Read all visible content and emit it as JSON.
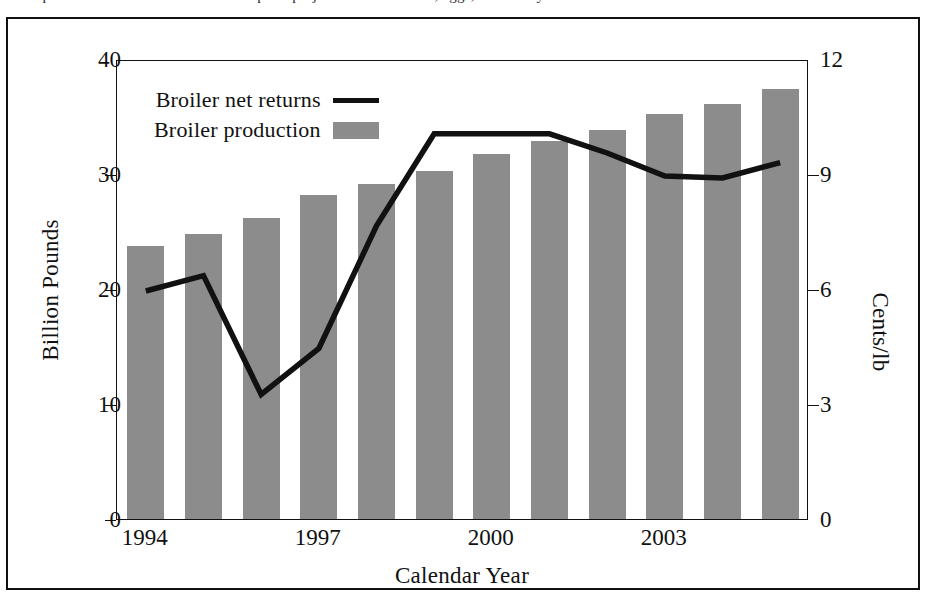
{
  "page": {
    "top_text_fragment": "anticipated to rise. This section reviews price projections for broilers, eggs, and turkeys."
  },
  "legend": {
    "items": [
      {
        "label": "Broiler net returns",
        "marker": "line-swatch",
        "color": "#111111"
      },
      {
        "label": "Broiler production",
        "marker": "bar-swatch",
        "color": "#8c8c8c"
      }
    ]
  },
  "axes": {
    "left": {
      "title": "Billion Pounds",
      "ticks": [
        "0",
        "10",
        "20",
        "30",
        "40"
      ],
      "min": 0,
      "max": 40
    },
    "right": {
      "title": "Cents/lb",
      "ticks": [
        "0",
        "3",
        "6",
        "9",
        "12"
      ],
      "min": 0,
      "max": 12
    },
    "bottom": {
      "title": "Calendar Year",
      "ticks": [
        "1994",
        "1997",
        "2000",
        "2003"
      ]
    }
  },
  "chart_data": {
    "type": "bar",
    "title": "",
    "xlabel": "Calendar Year",
    "ylabel": "Billion Pounds",
    "y2label": "Cents/lb",
    "ylim": [
      0,
      40
    ],
    "y2lim": [
      0,
      12
    ],
    "grid": false,
    "legend_position": "top-left-inside",
    "categories": [
      "1994",
      "1995",
      "1996",
      "1997",
      "1998",
      "1999",
      "2000",
      "2001",
      "2002",
      "2003",
      "2004",
      "2005"
    ],
    "series": [
      {
        "name": "Broiler production",
        "type": "bar",
        "axis": "left",
        "unit": "Billion Pounds",
        "color": "#8c8c8c",
        "values": [
          23.7,
          24.8,
          26.2,
          28.2,
          29.1,
          30.3,
          31.7,
          32.9,
          33.8,
          35.2,
          36.1,
          37.4
        ]
      },
      {
        "name": "Broiler net returns",
        "type": "line",
        "axis": "right",
        "unit": "Cents/lb",
        "color": "#111111",
        "values": [
          6.0,
          6.4,
          3.3,
          4.5,
          7.7,
          10.1,
          10.1,
          10.1,
          9.6,
          9.0,
          8.95,
          9.35
        ]
      }
    ]
  }
}
